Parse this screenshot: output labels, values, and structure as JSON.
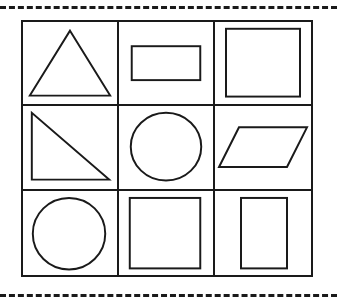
{
  "worksheet": {
    "title": "Geometric Shapes Grid",
    "background_color": "#ffffff",
    "stroke_color": "#1a1a1a",
    "cut_lines": [
      {
        "name": "top-cut-line",
        "position": "top",
        "style": "dashed"
      },
      {
        "name": "bottom-cut-line",
        "position": "bottom",
        "style": "dashed"
      }
    ],
    "grid": {
      "rows": 3,
      "columns": 3,
      "cell_count": 9,
      "border_style": "solid",
      "cells": [
        {
          "row": 1,
          "column": 1,
          "shape": "triangle",
          "shape_label": "Triangle",
          "icon_name": "triangle-icon",
          "description": "Isosceles triangle pointing up"
        },
        {
          "row": 1,
          "column": 2,
          "shape": "rectangle",
          "shape_label": "Rectangle",
          "icon_name": "rectangle-horizontal-icon",
          "description": "Wide horizontal rectangle"
        },
        {
          "row": 1,
          "column": 3,
          "shape": "square",
          "shape_label": "Square",
          "icon_name": "square-icon",
          "description": "Large square"
        },
        {
          "row": 2,
          "column": 1,
          "shape": "right-triangle",
          "shape_label": "Right Triangle",
          "icon_name": "right-triangle-icon",
          "description": "Right triangle with right angle at bottom left"
        },
        {
          "row": 2,
          "column": 2,
          "shape": "circle",
          "shape_label": "Circle",
          "icon_name": "circle-icon",
          "description": "Circle centered in cell"
        },
        {
          "row": 2,
          "column": 3,
          "shape": "parallelogram",
          "shape_label": "Parallelogram",
          "icon_name": "parallelogram-icon",
          "description": "Parallelogram slanting to the right"
        },
        {
          "row": 3,
          "column": 1,
          "shape": "circle",
          "shape_label": "Circle",
          "icon_name": "circle-icon",
          "description": "Circle centered in cell"
        },
        {
          "row": 3,
          "column": 2,
          "shape": "square",
          "shape_label": "Square",
          "icon_name": "square-icon",
          "description": "Large square"
        },
        {
          "row": 3,
          "column": 3,
          "shape": "rectangle",
          "shape_label": "Rectangle",
          "icon_name": "rectangle-vertical-icon",
          "description": "Tall vertical rectangle"
        }
      ]
    }
  }
}
